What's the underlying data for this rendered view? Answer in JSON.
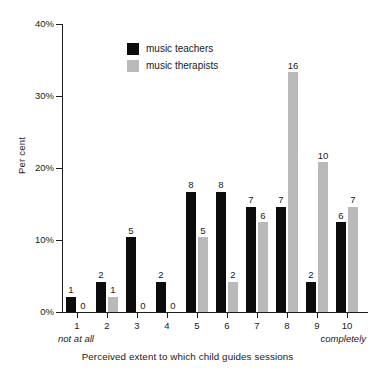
{
  "chart_data": {
    "type": "bar",
    "title": "",
    "xlabel": "Perceived extent to which child guides sessions",
    "ylabel": "Per cent",
    "categories": [
      "1",
      "2",
      "3",
      "4",
      "5",
      "6",
      "7",
      "8",
      "9",
      "10"
    ],
    "x_anchor_low": "not at all",
    "x_anchor_high": "completely",
    "ylim": [
      0,
      40
    ],
    "y_ticks": [
      "0%",
      "10%",
      "20%",
      "30%",
      "40%"
    ],
    "y_tick_values": [
      0,
      10,
      20,
      30,
      40
    ],
    "grid": false,
    "legend_position": "top-center",
    "series": [
      {
        "name": "music teachers",
        "color": "#0c0c0c",
        "counts": [
          1,
          2,
          5,
          2,
          8,
          8,
          7,
          7,
          2,
          6
        ],
        "values": [
          2.1,
          4.2,
          10.4,
          4.2,
          16.7,
          16.7,
          14.6,
          14.6,
          4.2,
          12.5
        ],
        "labels": [
          "1",
          "2",
          "5",
          "2",
          "8",
          "8",
          "7",
          "7",
          "2",
          "6"
        ]
      },
      {
        "name": "music therapists",
        "color": "#b9b9b9",
        "counts": [
          0,
          1,
          0,
          0,
          5,
          2,
          6,
          16,
          10,
          7
        ],
        "values": [
          0,
          2.1,
          0,
          0,
          10.4,
          4.2,
          12.5,
          33.3,
          20.8,
          14.6
        ],
        "labels": [
          "0",
          "1",
          "0",
          "0",
          "5",
          "2",
          "6",
          "16",
          "10",
          "7"
        ]
      }
    ]
  }
}
